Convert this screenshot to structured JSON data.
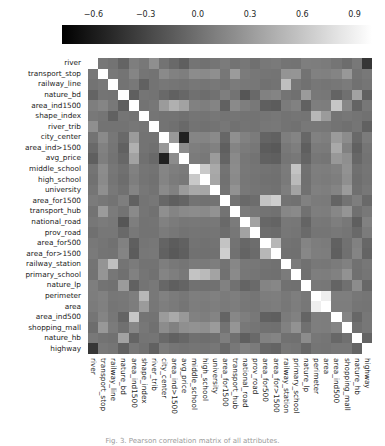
{
  "figure": {
    "kind": "correlation-matrix-heatmap",
    "caption": "Fig. 3. Pearson correlation matrix of all attributes."
  },
  "colorbar": {
    "orientation": "horizontal",
    "position": "top",
    "tick_labels": [
      "−0.6",
      "−0.3",
      "0.0",
      "0.3",
      "0.6",
      "0.9"
    ],
    "tick_values": [
      -0.6,
      -0.3,
      0.0,
      0.3,
      0.6,
      0.9
    ],
    "vmin": -0.78,
    "vmax": 1.0,
    "colormap": "gray",
    "low_color": "#000000",
    "high_color": "#ffffff"
  },
  "chart_data": {
    "type": "heatmap",
    "title": "",
    "xlabel": "",
    "ylabel": "",
    "grid": false,
    "legend_position": "top",
    "colormap": "gray",
    "vmin": -0.78,
    "vmax": 1.0,
    "symmetric": true,
    "categories": [
      "river",
      "transport_stop",
      "railway_line",
      "nature_bd",
      "area_ind1500",
      "shape_index",
      "river_trib",
      "city_center",
      "area_ind>1500",
      "avg_price",
      "middle_school",
      "high_school",
      "university",
      "area_for1500",
      "transport_hub",
      "national_road",
      "prov_road",
      "area_for500",
      "area_for>1500",
      "railway_station",
      "primary_school",
      "nature_lp",
      "perimeter",
      "area",
      "area_ind500",
      "shopping_mall",
      "nature_hb",
      "highway"
    ],
    "x": [
      "river",
      "transport_stop",
      "railway_line",
      "nature_bd",
      "area_ind1500",
      "shape_index",
      "river_trib",
      "city_center",
      "area_ind>1500",
      "avg_price",
      "middle_school",
      "high_school",
      "university",
      "area_for1500",
      "transport_hub",
      "national_road",
      "prov_road",
      "area_for500",
      "area_for>1500",
      "railway_station",
      "primary_school",
      "nature_lp",
      "perimeter",
      "area",
      "area_ind500",
      "shopping_mall",
      "nature_hb",
      "highway"
    ],
    "y": [
      "river",
      "transport_stop",
      "railway_line",
      "nature_bd",
      "area_ind1500",
      "shape_index",
      "river_trib",
      "city_center",
      "area_ind>1500",
      "avg_price",
      "middle_school",
      "high_school",
      "university",
      "area_for1500",
      "transport_hub",
      "national_road",
      "prov_road",
      "area_for500",
      "area_for>1500",
      "railway_station",
      "primary_school",
      "nature_lp",
      "perimeter",
      "area",
      "area_ind500",
      "shopping_mall",
      "nature_hb",
      "highway"
    ],
    "values": [
      [
        1.0,
        0.05,
        0.02,
        -0.08,
        0.1,
        0.06,
        0.22,
        0.02,
        -0.05,
        -0.12,
        0.03,
        0.01,
        0.04,
        0.08,
        0.02,
        0.05,
        0.0,
        0.06,
        0.07,
        0.03,
        0.02,
        0.1,
        0.09,
        0.08,
        0.04,
        -0.02,
        0.06,
        -0.4
      ],
      [
        0.05,
        1.0,
        0.06,
        0.03,
        0.15,
        0.04,
        0.02,
        0.18,
        0.12,
        0.1,
        0.2,
        0.18,
        0.22,
        0.05,
        0.3,
        0.08,
        0.05,
        0.04,
        0.03,
        0.25,
        0.26,
        0.02,
        0.12,
        0.11,
        0.14,
        0.28,
        0.02,
        0.06
      ],
      [
        0.02,
        0.06,
        1.0,
        0.02,
        0.06,
        -0.1,
        0.02,
        0.05,
        0.04,
        0.02,
        0.05,
        0.04,
        0.06,
        0.02,
        0.08,
        0.06,
        0.05,
        0.01,
        0.02,
        0.55,
        0.05,
        0.01,
        0.05,
        0.04,
        0.05,
        0.08,
        0.01,
        0.04
      ],
      [
        -0.08,
        0.03,
        0.02,
        1.0,
        -0.12,
        0.04,
        0.02,
        -0.05,
        -0.1,
        -0.06,
        0.0,
        -0.02,
        0.01,
        0.1,
        0.02,
        -0.18,
        -0.05,
        0.12,
        0.14,
        0.03,
        0.0,
        0.3,
        0.06,
        0.05,
        -0.08,
        0.0,
        0.35,
        -0.1
      ],
      [
        0.1,
        0.15,
        0.06,
        -0.12,
        1.0,
        0.02,
        0.05,
        0.3,
        0.45,
        0.35,
        0.12,
        0.1,
        0.14,
        -0.1,
        0.18,
        0.1,
        0.06,
        -0.12,
        -0.14,
        0.08,
        0.12,
        -0.1,
        0.1,
        0.09,
        0.6,
        0.16,
        -0.08,
        0.05
      ],
      [
        0.06,
        0.04,
        -0.1,
        0.04,
        0.02,
        1.0,
        0.04,
        0.02,
        0.02,
        0.0,
        0.04,
        0.03,
        0.05,
        0.03,
        0.04,
        0.02,
        0.02,
        0.04,
        0.05,
        0.02,
        0.04,
        0.03,
        0.5,
        0.3,
        0.03,
        0.05,
        0.03,
        0.01
      ],
      [
        0.22,
        0.02,
        0.02,
        0.02,
        0.05,
        0.04,
        1.0,
        0.02,
        0.0,
        -0.05,
        0.02,
        0.01,
        0.02,
        0.05,
        0.01,
        0.03,
        0.02,
        0.05,
        0.06,
        0.02,
        0.01,
        0.06,
        0.06,
        0.05,
        0.02,
        0.0,
        0.04,
        -0.1
      ],
      [
        0.02,
        0.18,
        0.05,
        -0.05,
        0.3,
        0.02,
        0.02,
        1.0,
        0.28,
        -0.55,
        0.15,
        0.14,
        0.18,
        -0.06,
        0.22,
        0.12,
        0.08,
        -0.08,
        -0.1,
        0.1,
        0.14,
        -0.06,
        0.12,
        0.1,
        0.3,
        0.2,
        -0.05,
        0.08
      ],
      [
        -0.05,
        0.12,
        0.04,
        -0.1,
        0.45,
        0.02,
        0.0,
        0.28,
        1.0,
        0.2,
        0.1,
        0.08,
        0.12,
        -0.12,
        0.14,
        0.08,
        0.05,
        -0.14,
        -0.16,
        0.06,
        0.1,
        -0.12,
        0.08,
        0.07,
        0.4,
        0.12,
        -0.1,
        0.04
      ],
      [
        -0.12,
        0.1,
        0.02,
        -0.06,
        0.35,
        0.0,
        -0.05,
        -0.55,
        0.2,
        1.0,
        0.08,
        0.06,
        0.3,
        -0.08,
        0.18,
        0.05,
        0.02,
        -0.1,
        -0.12,
        0.04,
        0.06,
        -0.08,
        0.05,
        0.04,
        0.28,
        0.22,
        -0.06,
        0.02
      ],
      [
        0.03,
        0.2,
        0.05,
        0.0,
        0.12,
        0.04,
        0.02,
        0.15,
        0.1,
        0.08,
        1.0,
        0.62,
        0.4,
        0.02,
        0.2,
        0.06,
        0.04,
        0.02,
        0.01,
        0.08,
        0.58,
        0.01,
        0.1,
        0.09,
        0.12,
        0.24,
        0.0,
        0.04
      ],
      [
        0.01,
        0.18,
        0.04,
        -0.02,
        0.1,
        0.03,
        0.01,
        0.14,
        0.08,
        0.06,
        0.62,
        1.0,
        0.38,
        0.01,
        0.18,
        0.05,
        0.03,
        0.01,
        0.0,
        0.07,
        0.52,
        0.0,
        0.09,
        0.08,
        0.1,
        0.22,
        -0.01,
        0.03
      ],
      [
        0.04,
        0.22,
        0.06,
        0.01,
        0.14,
        0.05,
        0.02,
        0.18,
        0.12,
        0.3,
        0.4,
        0.38,
        1.0,
        0.02,
        0.24,
        0.06,
        0.04,
        0.02,
        0.01,
        0.1,
        0.36,
        0.01,
        0.11,
        0.1,
        0.14,
        0.3,
        0.0,
        0.05
      ],
      [
        0.08,
        0.05,
        0.02,
        0.1,
        -0.1,
        0.03,
        0.05,
        -0.06,
        -0.12,
        -0.08,
        0.02,
        0.01,
        0.02,
        1.0,
        0.02,
        -0.05,
        -0.02,
        0.58,
        0.66,
        0.02,
        0.01,
        0.12,
        0.08,
        0.07,
        -0.08,
        0.02,
        0.1,
        -0.05
      ],
      [
        0.02,
        0.3,
        0.08,
        0.02,
        0.18,
        0.04,
        0.01,
        0.22,
        0.14,
        0.18,
        0.2,
        0.18,
        0.24,
        0.02,
        1.0,
        0.08,
        0.05,
        0.02,
        0.01,
        0.16,
        0.18,
        0.01,
        0.1,
        0.09,
        0.16,
        0.26,
        0.0,
        0.06
      ],
      [
        0.05,
        0.08,
        0.06,
        -0.18,
        0.1,
        0.02,
        0.03,
        0.12,
        0.08,
        0.05,
        0.06,
        0.05,
        0.06,
        -0.05,
        0.08,
        1.0,
        0.35,
        -0.06,
        -0.08,
        0.06,
        0.05,
        -0.08,
        0.06,
        0.05,
        0.1,
        0.06,
        -0.12,
        0.12
      ],
      [
        0.0,
        0.05,
        0.05,
        -0.05,
        0.06,
        0.02,
        0.02,
        0.08,
        0.05,
        0.02,
        0.04,
        0.03,
        0.04,
        -0.02,
        0.05,
        0.35,
        1.0,
        -0.02,
        -0.03,
        0.05,
        0.04,
        -0.04,
        0.04,
        0.04,
        0.06,
        0.04,
        -0.05,
        0.08
      ],
      [
        0.06,
        0.04,
        0.01,
        0.12,
        -0.12,
        0.04,
        0.05,
        -0.08,
        -0.14,
        -0.1,
        0.02,
        0.01,
        0.02,
        0.58,
        0.02,
        -0.06,
        -0.02,
        1.0,
        0.5,
        0.02,
        0.01,
        0.14,
        0.09,
        0.08,
        -0.1,
        0.01,
        0.12,
        -0.06
      ],
      [
        0.07,
        0.03,
        0.02,
        0.14,
        -0.14,
        0.05,
        0.06,
        -0.1,
        -0.16,
        -0.12,
        0.01,
        0.0,
        0.01,
        0.66,
        0.01,
        -0.08,
        -0.03,
        0.5,
        1.0,
        0.01,
        0.0,
        0.16,
        0.1,
        0.09,
        -0.12,
        0.0,
        0.14,
        -0.08
      ],
      [
        0.03,
        0.25,
        0.55,
        0.03,
        0.08,
        0.02,
        0.02,
        0.1,
        0.06,
        0.04,
        0.08,
        0.07,
        0.1,
        0.02,
        0.16,
        0.06,
        0.05,
        0.02,
        0.01,
        1.0,
        0.08,
        0.01,
        0.06,
        0.05,
        0.08,
        0.12,
        0.01,
        0.05
      ],
      [
        0.02,
        0.26,
        0.05,
        0.0,
        0.12,
        0.04,
        0.01,
        0.14,
        0.1,
        0.06,
        0.58,
        0.52,
        0.36,
        0.01,
        0.18,
        0.05,
        0.04,
        0.01,
        0.0,
        0.08,
        1.0,
        0.0,
        0.1,
        0.09,
        0.12,
        0.24,
        0.0,
        0.04
      ],
      [
        0.1,
        0.02,
        0.01,
        0.3,
        -0.1,
        0.03,
        0.06,
        -0.06,
        -0.12,
        -0.08,
        0.01,
        0.0,
        0.01,
        0.12,
        0.01,
        -0.08,
        -0.04,
        0.14,
        0.16,
        0.01,
        0.0,
        1.0,
        0.06,
        0.05,
        -0.08,
        0.0,
        0.2,
        -0.06
      ],
      [
        0.09,
        0.12,
        0.05,
        0.06,
        0.1,
        0.5,
        0.06,
        0.12,
        0.08,
        0.05,
        0.1,
        0.09,
        0.11,
        0.08,
        0.1,
        0.06,
        0.04,
        0.09,
        0.1,
        0.06,
        0.1,
        0.06,
        1.0,
        0.88,
        0.1,
        0.1,
        0.05,
        0.04
      ],
      [
        0.08,
        0.11,
        0.04,
        0.05,
        0.09,
        0.3,
        0.05,
        0.1,
        0.07,
        0.04,
        0.09,
        0.08,
        0.1,
        0.07,
        0.09,
        0.05,
        0.04,
        0.08,
        0.09,
        0.05,
        0.09,
        0.05,
        0.88,
        1.0,
        0.09,
        0.09,
        0.04,
        0.03
      ],
      [
        0.04,
        0.14,
        0.05,
        -0.08,
        0.6,
        0.03,
        0.02,
        0.3,
        0.4,
        0.28,
        0.12,
        0.1,
        0.14,
        -0.08,
        0.16,
        0.1,
        0.06,
        -0.1,
        -0.12,
        0.08,
        0.12,
        -0.08,
        0.1,
        0.09,
        1.0,
        0.14,
        -0.06,
        0.05
      ],
      [
        -0.02,
        0.28,
        0.08,
        0.0,
        0.16,
        0.05,
        0.0,
        0.2,
        0.12,
        0.22,
        0.24,
        0.22,
        0.3,
        0.02,
        0.26,
        0.06,
        0.04,
        0.01,
        0.0,
        0.12,
        0.24,
        0.0,
        0.1,
        0.09,
        0.14,
        1.0,
        0.0,
        0.05
      ],
      [
        0.06,
        0.02,
        0.01,
        0.35,
        -0.08,
        0.03,
        0.04,
        -0.05,
        -0.1,
        -0.06,
        0.0,
        -0.01,
        0.0,
        0.1,
        0.0,
        -0.12,
        -0.05,
        0.12,
        0.14,
        0.01,
        0.0,
        0.2,
        0.05,
        0.04,
        -0.06,
        0.0,
        1.0,
        -0.08
      ],
      [
        -0.4,
        0.06,
        0.04,
        -0.1,
        0.05,
        0.01,
        -0.1,
        0.08,
        0.04,
        0.02,
        0.04,
        0.03,
        0.05,
        -0.05,
        0.06,
        0.12,
        0.08,
        -0.06,
        -0.08,
        0.05,
        0.04,
        -0.06,
        0.04,
        0.03,
        0.05,
        0.05,
        -0.08,
        1.0
      ]
    ]
  }
}
